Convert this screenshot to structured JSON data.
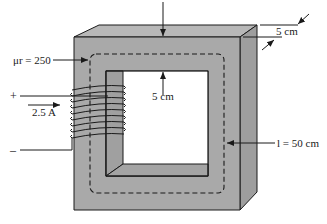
{
  "diagram": {
    "type": "magnetic-circuit",
    "colors": {
      "core_face": "#a9a9a9",
      "core_top": "#b8b8b8",
      "core_side": "#9a9a9a",
      "inner_wall": "#8f8f8f",
      "line": "#1a1a1a",
      "background": "#ffffff"
    },
    "labels": {
      "permeability": "μr = 250",
      "current": "2.5 A",
      "plus": "+",
      "minus": "–",
      "depth_dim": "5 cm",
      "width_dim": "5 cm",
      "path_length": "l = 50 cm"
    },
    "coil": {
      "turns": 9
    }
  }
}
